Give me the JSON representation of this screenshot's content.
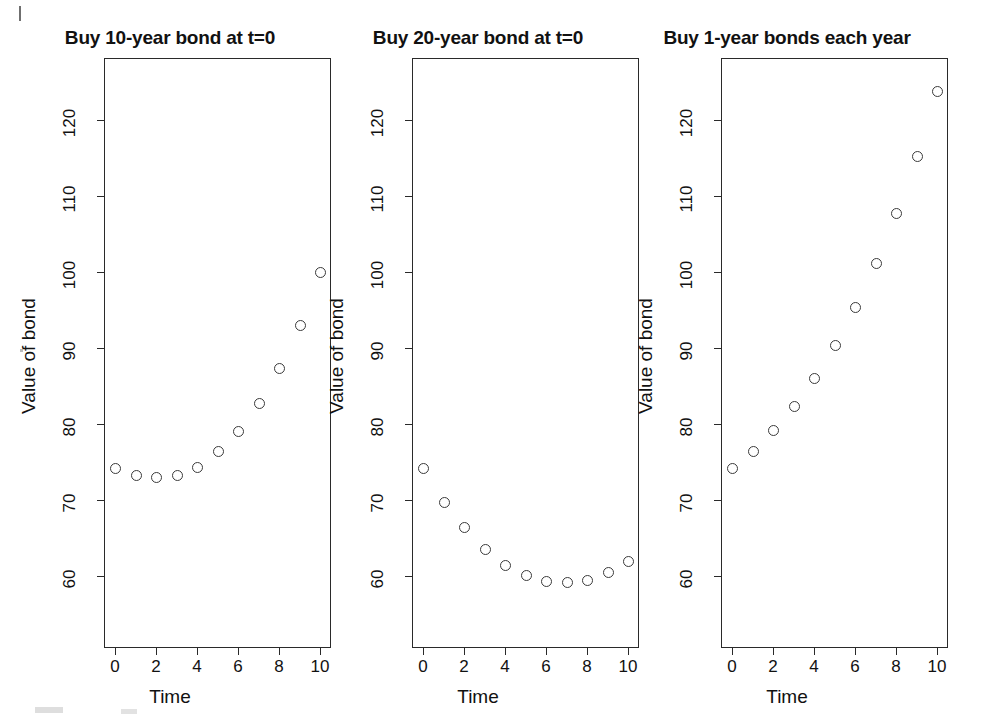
{
  "figure": {
    "background_color": "#ffffff",
    "ink_color": "#2a2a2a",
    "point_color": "#3a3a3a"
  },
  "chart_data": [
    {
      "type": "scatter",
      "title": "Buy 10-year bond at t=0",
      "xlabel": "Time",
      "ylabel": "Value of bond",
      "xlim": [
        -0.55,
        10.55
      ],
      "ylim": [
        55.5,
        126.5
      ],
      "xticks": [
        0,
        2,
        4,
        6,
        8,
        10
      ],
      "yticks": [
        60,
        70,
        80,
        90,
        100,
        110,
        120
      ],
      "grid": false,
      "legend": "none",
      "marker": "open-circle",
      "x": [
        0,
        1,
        2,
        3,
        4,
        5,
        6,
        7,
        8,
        9,
        10
      ],
      "y": [
        74.2,
        73.3,
        73.0,
        73.3,
        74.4,
        76.4,
        79.1,
        82.7,
        87.4,
        93.0,
        100.0
      ]
    },
    {
      "type": "scatter",
      "title": "Buy 20-year bond at t=0",
      "xlabel": "Time",
      "ylabel": "Value of bond",
      "xlim": [
        -0.55,
        10.55
      ],
      "ylim": [
        55.5,
        126.5
      ],
      "xticks": [
        0,
        2,
        4,
        6,
        8,
        10
      ],
      "yticks": [
        60,
        70,
        80,
        90,
        100,
        110,
        120
      ],
      "grid": false,
      "legend": "none",
      "marker": "open-circle",
      "x": [
        0,
        1,
        2,
        3,
        4,
        5,
        6,
        7,
        8,
        9,
        10
      ],
      "y": [
        74.2,
        69.8,
        66.4,
        63.6,
        61.5,
        60.1,
        59.4,
        59.2,
        59.5,
        60.5,
        62.0
      ]
    },
    {
      "type": "scatter",
      "title": "Buy 1-year bonds each year",
      "xlabel": "Time",
      "ylabel": "Value of bond",
      "xlim": [
        -0.55,
        10.55
      ],
      "ylim": [
        55.5,
        126.5
      ],
      "xticks": [
        0,
        2,
        4,
        6,
        8,
        10
      ],
      "yticks": [
        60,
        70,
        80,
        90,
        100,
        110,
        120
      ],
      "grid": false,
      "legend": "none",
      "marker": "open-circle",
      "x": [
        0,
        1,
        2,
        3,
        4,
        5,
        6,
        7,
        8,
        9,
        10
      ],
      "y": [
        74.2,
        76.5,
        79.2,
        82.4,
        86.1,
        90.4,
        95.4,
        101.2,
        107.8,
        115.3,
        123.8
      ]
    }
  ],
  "panels": [
    {
      "id": "panel-10-year",
      "title": "Buy 10-year bond at t=0",
      "ylabel": "Value of bond",
      "xlabel": "Time",
      "ytick_labels": [
        "60",
        "70",
        "80",
        "90",
        "100",
        "110",
        "120"
      ],
      "xtick_labels": [
        "0",
        "2",
        "4",
        "6",
        "8",
        "10"
      ]
    },
    {
      "id": "panel-20-year",
      "title": "Buy 20-year bond at t=0",
      "ylabel": "Value of bond",
      "xlabel": "Time",
      "ytick_labels": [
        "60",
        "70",
        "80",
        "90",
        "100",
        "110",
        "120"
      ],
      "xtick_labels": [
        "0",
        "2",
        "4",
        "6",
        "8",
        "10"
      ]
    },
    {
      "id": "panel-1-year",
      "title": "Buy 1-year bonds each year",
      "ylabel": "Value of bond",
      "xlabel": "Time",
      "ytick_labels": [
        "60",
        "70",
        "80",
        "90",
        "100",
        "110",
        "120"
      ],
      "xtick_labels": [
        "0",
        "2",
        "4",
        "6",
        "8",
        "10"
      ]
    }
  ]
}
